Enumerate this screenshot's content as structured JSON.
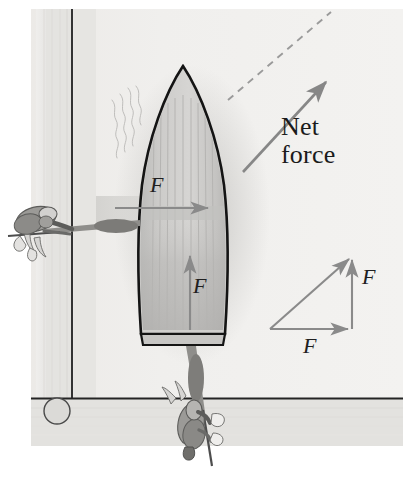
{
  "figure": {
    "kind": "physics-force-diagram",
    "caption_free": true,
    "width": 403,
    "height": 481
  },
  "labels": {
    "net_force": "Net\nforce",
    "force_horizontal_boat": "F",
    "force_vertical_boat": "F",
    "force_horizontal_triangle": "F",
    "force_vertical_triangle": "F"
  },
  "vectors": {
    "net_force_arrow": {
      "name": "net-force-arrow",
      "from": [
        243,
        172
      ],
      "to": [
        330,
        78
      ],
      "label": "Net force",
      "style": "solid"
    },
    "net_force_guide": {
      "name": "net-force-dashed-guide",
      "from": [
        228,
        100
      ],
      "to": [
        331,
        12
      ],
      "style": "dashed"
    },
    "boat_force_horizontal": {
      "name": "boat-horizontal-force-arrow",
      "from": [
        115,
        208
      ],
      "to": [
        213,
        208
      ],
      "label": "F",
      "direction": "right"
    },
    "boat_force_vertical": {
      "name": "boat-vertical-force-arrow",
      "from": [
        190,
        330
      ],
      "to": [
        190,
        251
      ],
      "label": "F",
      "direction": "up"
    },
    "triangle_horizontal": {
      "name": "triangle-horizontal-force-arrow",
      "from": [
        270,
        329
      ],
      "to": [
        352,
        329
      ],
      "label": "F",
      "direction": "right"
    },
    "triangle_vertical": {
      "name": "triangle-vertical-force-arrow",
      "from": [
        352,
        329
      ],
      "to": [
        352,
        256
      ],
      "label": "F",
      "direction": "up"
    },
    "triangle_resultant": {
      "name": "triangle-resultant-arrow",
      "from": [
        270,
        329
      ],
      "to": [
        352,
        256
      ],
      "direction": "up-right"
    }
  },
  "scene": {
    "boat": {
      "name": "rowboat",
      "bow_tip": [
        183,
        66
      ],
      "stern_y": 350,
      "beam_left": 136,
      "beam_right": 231,
      "plank_count": 11
    },
    "people": [
      {
        "name": "person-pushing-from-left",
        "position": [
          45,
          222
        ],
        "pole": true
      },
      {
        "name": "person-pushing-from-below",
        "position": [
          200,
          420
        ],
        "pole": true
      }
    ],
    "dock": {
      "name": "dock-pier",
      "vertical_edge_x": 72,
      "horizontal_edge_y": 398
    },
    "mooring_post": {
      "name": "mooring-post-circle",
      "center": [
        57,
        411
      ],
      "radius": 13
    },
    "ripples": {
      "name": "water-ripples",
      "count": 4
    }
  },
  "colors": {
    "background_paper": "#f2f2f0",
    "water_light": "#ededeb",
    "water_mid": "#e2e2df",
    "dock_plank": "#d9d9d5",
    "dock_line": "#2a2a2a",
    "boat_outline": "#141414",
    "boat_fill": "#c8c8c6",
    "boat_fill_dark": "#b4b4b2",
    "arrow_gray": "#8a8a8a",
    "arrow_gray_dark": "#7d7d7d",
    "dashed_gray": "#9a9a9a",
    "person_light": "#cfcfcf",
    "person_mid": "#a5a5a5",
    "person_dark": "#828282",
    "text": "#1b1b1b"
  }
}
